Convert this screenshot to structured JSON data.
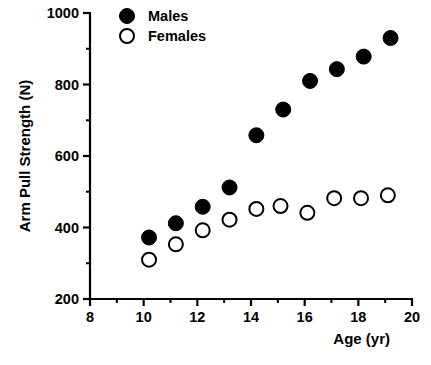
{
  "chart_data": {
    "type": "scatter",
    "title": "",
    "xlabel": "Age  (yr)",
    "ylabel": "Arm Pull Strength (N)",
    "xlim": [
      8,
      20
    ],
    "ylim": [
      200,
      1000
    ],
    "x_ticks": [
      8,
      10,
      12,
      14,
      16,
      18,
      20
    ],
    "x_tick_labels": [
      "8",
      "10",
      "12",
      "14",
      "16",
      "18",
      "20"
    ],
    "x_minor_ticks": [
      9,
      11,
      13,
      15,
      17,
      19
    ],
    "y_ticks": [
      200,
      400,
      600,
      800,
      1000
    ],
    "y_tick_labels": [
      "200",
      "400",
      "600",
      "800",
      "1000"
    ],
    "y_minor_ticks": [
      300,
      500,
      700,
      900
    ],
    "grid": false,
    "legend_position": "top-left",
    "series": [
      {
        "name": "Males",
        "marker": "filled-circle",
        "color": "#000000",
        "points": [
          {
            "x": 10.2,
            "y": 372
          },
          {
            "x": 11.2,
            "y": 412
          },
          {
            "x": 12.2,
            "y": 458
          },
          {
            "x": 13.2,
            "y": 512
          },
          {
            "x": 14.2,
            "y": 658
          },
          {
            "x": 15.2,
            "y": 730
          },
          {
            "x": 16.2,
            "y": 810
          },
          {
            "x": 17.2,
            "y": 843
          },
          {
            "x": 18.2,
            "y": 878
          },
          {
            "x": 19.2,
            "y": 930
          }
        ]
      },
      {
        "name": "Females",
        "marker": "open-circle",
        "color": "#000000",
        "points": [
          {
            "x": 10.2,
            "y": 310
          },
          {
            "x": 11.2,
            "y": 353
          },
          {
            "x": 12.2,
            "y": 392
          },
          {
            "x": 13.2,
            "y": 422
          },
          {
            "x": 14.2,
            "y": 452
          },
          {
            "x": 15.1,
            "y": 460
          },
          {
            "x": 16.1,
            "y": 441
          },
          {
            "x": 17.1,
            "y": 482
          },
          {
            "x": 18.1,
            "y": 482
          },
          {
            "x": 19.1,
            "y": 490
          }
        ]
      }
    ]
  },
  "legend": {
    "entries": [
      {
        "label": "Males",
        "marker": "filled-circle"
      },
      {
        "label": "Females",
        "marker": "open-circle"
      }
    ]
  },
  "axes": {
    "y_title": "Arm Pull Strength (N)",
    "x_title": "Age  (yr)"
  }
}
